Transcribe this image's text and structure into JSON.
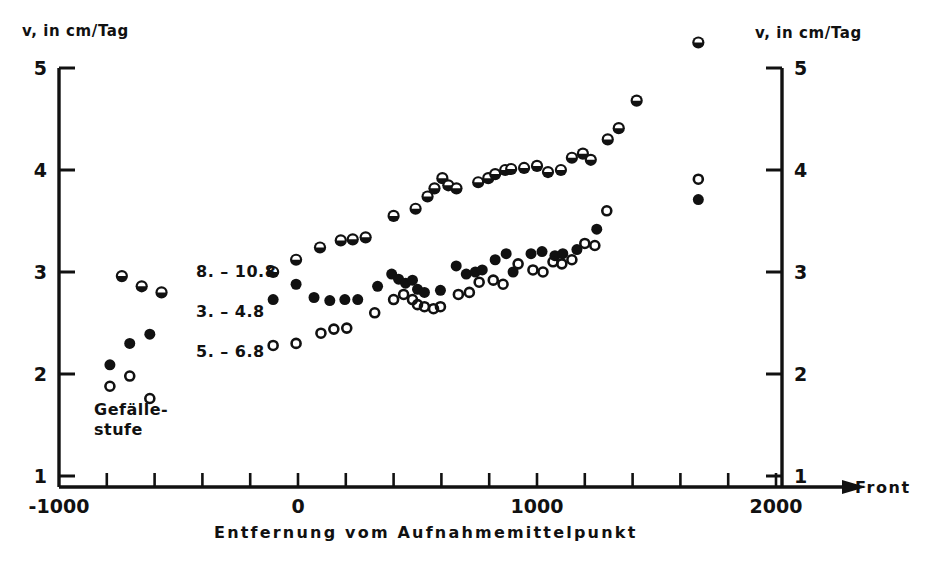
{
  "figure": {
    "left_axis_label": "v, in cm/Tag",
    "right_axis_label": "v, in cm/Tag",
    "x_axis_title": "Entfernung vom Aufnahmemittelpunkt",
    "front_label": "Front",
    "annotation": "Gefälle-\nstufe",
    "annotation_line1": "Gefälle-",
    "annotation_line2": "stufe",
    "line_color": "#111111",
    "marker_color": "#111111",
    "background": "#ffffff"
  },
  "chart_data": {
    "type": "scatter",
    "title": "",
    "xlabel": "Entfernung vom Aufnahmemittelpunkt",
    "ylabel": "v, in cm/Tag",
    "xlim": [
      -1000,
      2000
    ],
    "ylim": [
      0.6,
      5.45
    ],
    "xticks": [
      -1000,
      -800,
      -600,
      -400,
      -200,
      0,
      200,
      400,
      600,
      800,
      1000,
      1200,
      1400,
      1600,
      1800,
      2000
    ],
    "xticklabels": [
      "-1000",
      "",
      "",
      "",
      "",
      "0",
      "",
      "",
      "",
      "",
      "1000",
      "",
      "",
      "",
      "",
      "2000"
    ],
    "yticks": [
      1,
      2,
      3,
      4,
      5
    ],
    "yticklabels": [
      "1",
      "2",
      "3",
      "4",
      "5"
    ],
    "grid": false,
    "legend_position": "inside-left",
    "series": [
      {
        "name": "8. – 10.8",
        "marker": "half-filled-circle",
        "points": [
          [
            -737,
            2.96
          ],
          [
            -654,
            2.86
          ],
          [
            -571,
            2.8
          ],
          [
            -104,
            3.0
          ],
          [
            -8,
            3.12
          ],
          [
            92,
            3.24
          ],
          [
            179,
            3.31
          ],
          [
            229,
            3.32
          ],
          [
            283,
            3.34
          ],
          [
            400,
            3.55
          ],
          [
            492,
            3.62
          ],
          [
            542,
            3.74
          ],
          [
            571,
            3.82
          ],
          [
            604,
            3.92
          ],
          [
            629,
            3.85
          ],
          [
            663,
            3.82
          ],
          [
            754,
            3.88
          ],
          [
            796,
            3.92
          ],
          [
            825,
            3.96
          ],
          [
            867,
            4.0
          ],
          [
            892,
            4.01
          ],
          [
            946,
            4.02
          ],
          [
            1000,
            4.04
          ],
          [
            1046,
            3.98
          ],
          [
            1100,
            4.0
          ],
          [
            1146,
            4.12
          ],
          [
            1192,
            4.16
          ],
          [
            1225,
            4.1
          ],
          [
            1296,
            4.3
          ],
          [
            1342,
            4.41
          ],
          [
            1417,
            4.68
          ],
          [
            1675,
            5.25
          ]
        ]
      },
      {
        "name": "3. – 4.8",
        "marker": "filled-circle",
        "points": [
          [
            -787,
            2.09
          ],
          [
            -704,
            2.3
          ],
          [
            -620,
            2.39
          ],
          [
            -104,
            2.73
          ],
          [
            -8,
            2.88
          ],
          [
            67,
            2.75
          ],
          [
            133,
            2.72
          ],
          [
            196,
            2.73
          ],
          [
            250,
            2.73
          ],
          [
            333,
            2.86
          ],
          [
            392,
            2.98
          ],
          [
            421,
            2.93
          ],
          [
            450,
            2.89
          ],
          [
            479,
            2.92
          ],
          [
            500,
            2.83
          ],
          [
            529,
            2.8
          ],
          [
            596,
            2.82
          ],
          [
            662,
            3.06
          ],
          [
            704,
            2.98
          ],
          [
            742,
            3.0
          ],
          [
            771,
            3.02
          ],
          [
            825,
            3.12
          ],
          [
            871,
            3.18
          ],
          [
            900,
            3.0
          ],
          [
            975,
            3.18
          ],
          [
            1021,
            3.2
          ],
          [
            1075,
            3.16
          ],
          [
            1108,
            3.18
          ],
          [
            1167,
            3.22
          ],
          [
            1250,
            3.42
          ],
          [
            1675,
            3.71
          ]
        ]
      },
      {
        "name": "5. – 6.8",
        "marker": "open-circle",
        "points": [
          [
            -787,
            1.88
          ],
          [
            -704,
            1.98
          ],
          [
            -620,
            1.76
          ],
          [
            -104,
            2.28
          ],
          [
            -8,
            2.3
          ],
          [
            96,
            2.4
          ],
          [
            150,
            2.44
          ],
          [
            204,
            2.45
          ],
          [
            321,
            2.6
          ],
          [
            400,
            2.73
          ],
          [
            442,
            2.78
          ],
          [
            479,
            2.73
          ],
          [
            500,
            2.68
          ],
          [
            529,
            2.66
          ],
          [
            567,
            2.64
          ],
          [
            596,
            2.66
          ],
          [
            671,
            2.78
          ],
          [
            717,
            2.8
          ],
          [
            758,
            2.9
          ],
          [
            817,
            2.92
          ],
          [
            858,
            2.88
          ],
          [
            921,
            3.08
          ],
          [
            983,
            3.02
          ],
          [
            1025,
            3.0
          ],
          [
            1067,
            3.1
          ],
          [
            1104,
            3.08
          ],
          [
            1146,
            3.12
          ],
          [
            1200,
            3.28
          ],
          [
            1242,
            3.26
          ],
          [
            1292,
            3.6
          ],
          [
            1675,
            3.91
          ]
        ]
      }
    ],
    "annotations": [
      {
        "text": "Gefälle-stufe",
        "x": -760,
        "y": 1.45
      }
    ]
  },
  "legend": {
    "items": [
      {
        "label": "8. – 10.8",
        "marker": "half-filled-circle"
      },
      {
        "label": "3. – 4.8",
        "marker": "filled-circle"
      },
      {
        "label": "5. – 6.8",
        "marker": "open-circle"
      }
    ]
  }
}
